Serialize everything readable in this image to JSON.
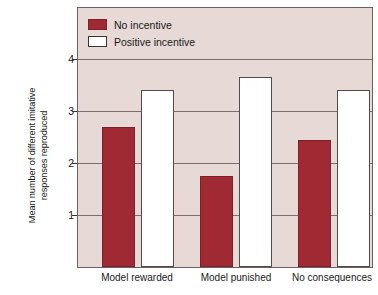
{
  "chart_data": {
    "type": "bar",
    "title": "",
    "xlabel": "",
    "ylabel_line1": "Mean number of different imitative",
    "ylabel_line2": "responses reproduced",
    "categories": [
      "Model rewarded",
      "Model punished",
      "No consequences"
    ],
    "series": [
      {
        "name": "No incentive",
        "color": "#a02a33",
        "values": [
          2.7,
          1.75,
          2.45
        ]
      },
      {
        "name": "Positive incentive",
        "color": "#ffffff",
        "values": [
          3.4,
          3.65,
          3.4
        ]
      }
    ],
    "ylim": [
      0,
      4.5
    ],
    "yticks": [
      1,
      2,
      3,
      4
    ],
    "ytick_labels": [
      "1",
      "2",
      "3",
      "4"
    ],
    "grid": true,
    "legend_position": "top-left",
    "plot_background": "#e6d9d6",
    "gridline_color": "#7d6d6d"
  }
}
